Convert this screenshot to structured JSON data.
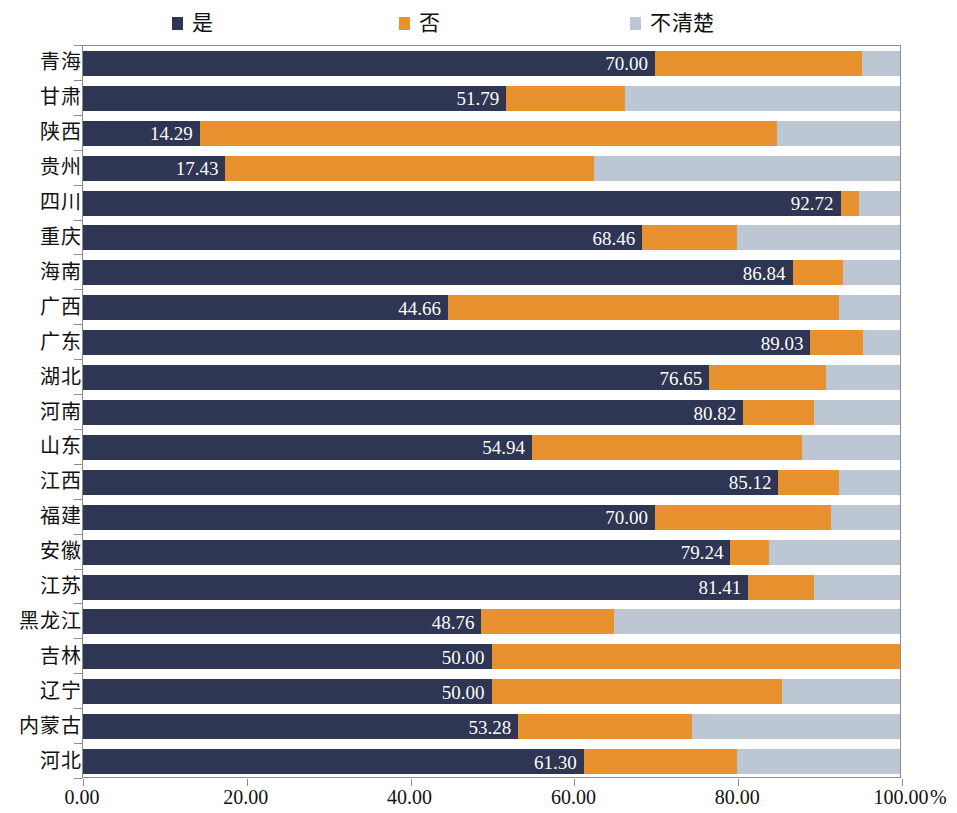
{
  "legend": {
    "items": [
      {
        "label": "是",
        "color": "#2f3654",
        "key": "yes"
      },
      {
        "label": "否",
        "color": "#e8912f",
        "key": "no"
      },
      {
        "label": "不清楚",
        "color": "#bcc7d3",
        "key": "unknown"
      }
    ]
  },
  "axis": {
    "x_ticks": [
      "0.00",
      "20.00",
      "40.00",
      "60.00",
      "80.00",
      "100.00"
    ],
    "x_unit": "%",
    "x_min": 0,
    "x_max": 100
  },
  "chart_data": {
    "type": "bar",
    "orientation": "horizontal",
    "stacked": true,
    "stacked_normalized": true,
    "title": "",
    "subtitle": "",
    "xlabel": "%",
    "ylabel": "",
    "xlim": [
      0,
      100
    ],
    "xticks": [
      0,
      20,
      40,
      60,
      80,
      100
    ],
    "xticklabels": [
      "0.00",
      "20.00",
      "40.00",
      "60.00",
      "80.00",
      "100.00"
    ],
    "grid": false,
    "legend_position": "top",
    "legend": [
      "是",
      "否",
      "不清楚"
    ],
    "categories": [
      "青海",
      "甘肃",
      "陕西",
      "贵州",
      "四川",
      "重庆",
      "海南",
      "广西",
      "广东",
      "湖北",
      "河南",
      "山东",
      "江西",
      "福建",
      "安徽",
      "江苏",
      "黑龙江",
      "吉林",
      "辽宁",
      "内蒙古",
      "河北"
    ],
    "series": [
      {
        "name": "是",
        "color": "#2f3654",
        "values": [
          70.0,
          51.79,
          14.29,
          17.43,
          92.72,
          68.46,
          86.84,
          44.66,
          89.03,
          76.65,
          80.82,
          54.94,
          85.12,
          70.0,
          79.24,
          81.41,
          48.76,
          50.0,
          50.0,
          53.28,
          61.3
        ]
      },
      {
        "name": "否",
        "color": "#e8912f",
        "values": [
          25.3,
          14.51,
          70.71,
          45.07,
          2.28,
          11.54,
          6.16,
          47.84,
          6.47,
          14.35,
          8.68,
          33.06,
          7.38,
          21.5,
          4.76,
          8.09,
          16.24,
          50.0,
          35.5,
          21.22,
          18.7
        ]
      },
      {
        "name": "不清楚",
        "color": "#bcc7d3",
        "values": [
          4.7,
          33.7,
          15.0,
          37.5,
          5.0,
          20.0,
          7.0,
          7.5,
          4.5,
          9.0,
          10.5,
          12.0,
          7.5,
          8.5,
          16.0,
          10.5,
          35.0,
          0.0,
          14.5,
          25.5,
          20.0
        ]
      }
    ],
    "bar_labels": [
      "70.00",
      "51.79",
      "14.29",
      "17.43",
      "92.72",
      "68.46",
      "86.84",
      "44.66",
      "89.03",
      "76.65",
      "80.82",
      "54.94",
      "85.12",
      "70.00",
      "79.24",
      "81.41",
      "48.76",
      "50.00",
      "50.00",
      "53.28",
      "61.30"
    ]
  }
}
